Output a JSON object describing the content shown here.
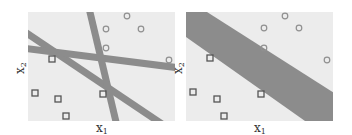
{
  "colors": {
    "panel_bg": "#ececec",
    "band": "#8c8c8c",
    "marker": "#555555",
    "circle": "#909090"
  },
  "panels": [
    {
      "name": "multiple-separating-lines",
      "x_label": "x",
      "x_sub": "1",
      "y_label": "x",
      "y_sub": "2",
      "squares": [
        [
          52,
          59
        ],
        [
          35,
          93
        ],
        [
          58,
          99
        ],
        [
          66,
          116
        ],
        [
          103,
          94
        ]
      ],
      "circles": [
        [
          106,
          29
        ],
        [
          127,
          16
        ],
        [
          141,
          29
        ],
        [
          106,
          48
        ],
        [
          169,
          60
        ]
      ]
    },
    {
      "name": "maximum-margin-band",
      "x_label": "x",
      "x_sub": "1",
      "y_label": "x",
      "y_sub": "2",
      "squares": [
        [
          210,
          58
        ],
        [
          193,
          92
        ],
        [
          217,
          99
        ],
        [
          224,
          116
        ],
        [
          261,
          94
        ]
      ],
      "circles": [
        [
          264,
          28
        ],
        [
          285,
          16
        ],
        [
          299,
          28
        ],
        [
          264,
          48
        ],
        [
          327,
          60
        ]
      ]
    }
  ]
}
